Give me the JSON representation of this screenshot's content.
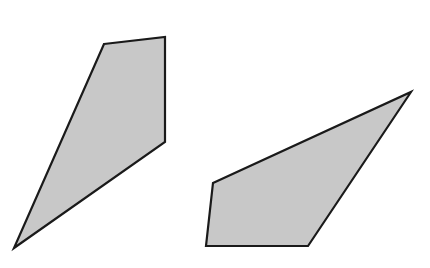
{
  "canvas": {
    "width": 430,
    "height": 268,
    "background": "#ffffff"
  },
  "shapes": [
    {
      "name": "left-quadrilateral",
      "points": "104,44 165,37 165,142 14,248",
      "fill": "#c8c8c8",
      "stroke": "#1a1a1a"
    },
    {
      "name": "right-quadrilateral",
      "points": "213,183 411,92 308,246 206,246",
      "fill": "#c8c8c8",
      "stroke": "#1a1a1a"
    }
  ]
}
